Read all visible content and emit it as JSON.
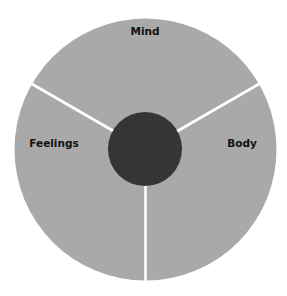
{
  "diagram": {
    "type": "three-segment circle",
    "segments": [
      {
        "label": "Mind"
      },
      {
        "label": "Feelings"
      },
      {
        "label": "Body"
      }
    ],
    "colors": {
      "segment_fill": "#a9a9a9",
      "center_fill": "#353535",
      "divider": "#ffffff",
      "background": "#ffffff"
    }
  }
}
